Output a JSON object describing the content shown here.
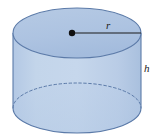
{
  "figure": {
    "name": "cylinder-diagram",
    "shape_type": "right circular cylinder",
    "background_color": "#ffffff",
    "labels": {
      "radius": "r",
      "height": "h"
    },
    "geometry": {
      "center_x": 77,
      "top_ellipse_center_y": 33,
      "bottom_ellipse_center_y": 108,
      "radius_x": 64,
      "radius_y": 25,
      "left_edge_x": 13,
      "right_edge_x": 141,
      "radius_dot_x": 72,
      "radius_dot_y": 33,
      "radius_line_end_x": 141
    },
    "colors": {
      "top_face_fill": "#aec4e1",
      "body_fill": "#bed1e8",
      "bottom_face_fill": "#b8cde6",
      "stroke": "#5b7aa8",
      "dashed_stroke": "#5b7aa8",
      "radius_line": "#1a1a1a",
      "center_dot": "#111111",
      "label_text": "#1a1a1a"
    }
  }
}
